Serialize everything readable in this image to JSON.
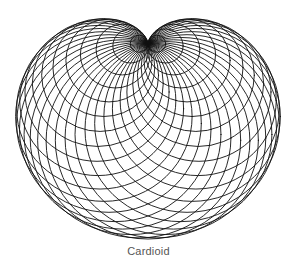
{
  "figure": {
    "caption": "Cardioid",
    "shape": "cardioid",
    "construction": "envelope of circles through a fixed cusp point with centers on a base circle",
    "colors": {
      "background": "#ffffff",
      "stroke": "#111111",
      "caption": "#555555"
    },
    "geometry": {
      "cusp": [
        148,
        43
      ],
      "base_circle_radius": 49,
      "circle_count": 36,
      "x_scale": 1.04
    }
  }
}
